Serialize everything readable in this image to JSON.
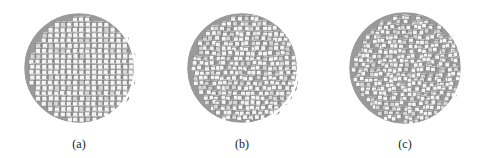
{
  "figure": {
    "panels": [
      {
        "label": "(a)",
        "description": "voxelized sphere, regular cubic lattice, orderly terraced rows of cubes",
        "cx": 79,
        "cy": 68,
        "r": 56,
        "voxel_size": 6.2,
        "disorder": 0.15
      },
      {
        "label": "(b)",
        "description": "voxelized sphere, moderately disordered surface of cubes",
        "cx": 242,
        "cy": 68,
        "r": 56,
        "voxel_size": 5.8,
        "disorder": 0.55
      },
      {
        "label": "(c)",
        "description": "voxelized sphere, highly disordered rough surface of cubes",
        "cx": 405,
        "cy": 68,
        "r": 57,
        "voxel_size": 5.6,
        "disorder": 0.9
      }
    ],
    "colors": {
      "background": "#ffffff",
      "cube_face_light": "#f4f4f4",
      "cube_face_mid": "#c4c4c4",
      "cube_face_dark": "#8a8a8a",
      "cube_edge": "#6e6e6e",
      "caption_text": "#222222"
    }
  }
}
